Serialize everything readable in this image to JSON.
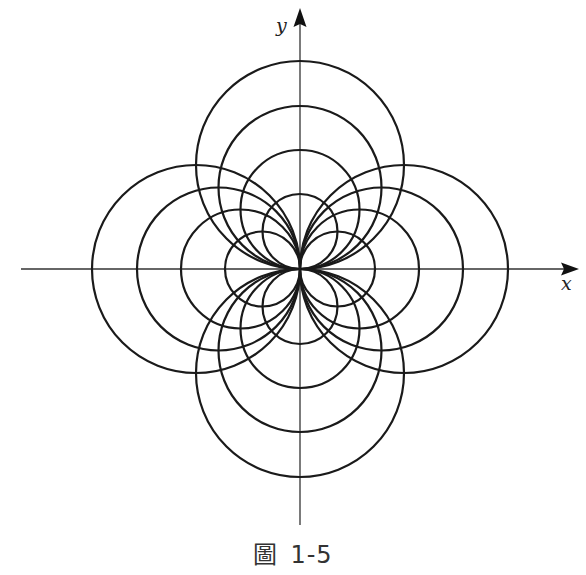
{
  "figure": {
    "caption_prefix": "圖",
    "caption_number": "1-5",
    "x_axis_label": "x",
    "y_axis_label": "y",
    "line_color": "#1a1a1a",
    "axis_color": "#333333"
  },
  "diagram": {
    "type": "family-of-circles-tangent-at-origin",
    "origin_px": [
      300,
      269
    ],
    "circle_diameters_px": [
      75,
      119,
      163,
      208
    ],
    "families": [
      {
        "name": "upper",
        "direction": "+y",
        "count": 4
      },
      {
        "name": "lower",
        "direction": "-y",
        "count": 4
      },
      {
        "name": "right",
        "direction": "+x",
        "count": 4
      },
      {
        "name": "left",
        "direction": "-x",
        "count": 4
      }
    ],
    "x_axis_range_px": [
      21,
      578
    ],
    "y_axis_range_px": [
      8,
      525
    ]
  }
}
